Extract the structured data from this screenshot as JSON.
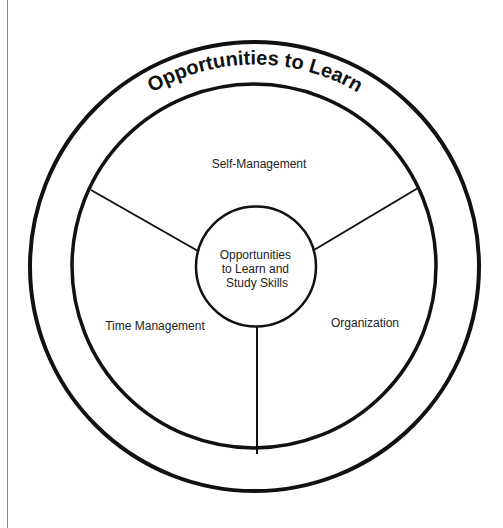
{
  "diagram": {
    "title": "Opportunities to Learn",
    "center": {
      "lines": [
        "Opportunities",
        "to Learn and",
        "Study Skills"
      ]
    },
    "segments": [
      {
        "label": "Self-Management",
        "position": "top"
      },
      {
        "label": "Time Management",
        "position": "bottom-left"
      },
      {
        "label": "Organization",
        "position": "bottom-right"
      }
    ],
    "colors": {
      "stroke": "#111111",
      "text": "#222222",
      "background": "#ffffff",
      "page_edge": "#8a8a8a"
    }
  }
}
